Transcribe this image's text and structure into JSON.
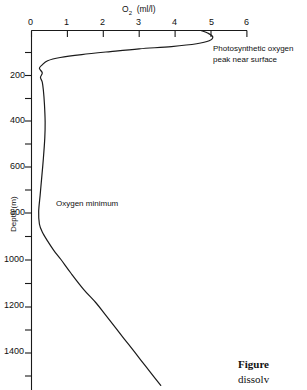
{
  "chart_data": {
    "type": "line",
    "xlabel": "O2  (ml/l)",
    "ylabel": "Depth (m)",
    "xlim": [
      0,
      6
    ],
    "ylim": [
      1550,
      0
    ],
    "x_ticks": [
      0,
      1,
      2,
      3,
      4,
      5,
      6
    ],
    "x_tick_labels": [
      "0",
      "1",
      "2",
      "3",
      "4",
      "5",
      "6"
    ],
    "y_ticks": [
      0,
      100,
      200,
      300,
      400,
      500,
      600,
      700,
      800,
      900,
      1000,
      1100,
      1200,
      1300,
      1400,
      1500
    ],
    "y_tick_labels": [
      "",
      "",
      "200",
      "",
      "400",
      "",
      "600",
      "",
      "800",
      "",
      "1000",
      "",
      "1200",
      "",
      "1400",
      ""
    ],
    "y_major_labeled": [
      200,
      400,
      600,
      800,
      1000,
      1200,
      1400
    ],
    "grid": false,
    "legend": "none",
    "series": [
      {
        "name": "Dissolved oxygen profile",
        "points": [
          [
            4.72,
            0
          ],
          [
            4.92,
            12
          ],
          [
            5.05,
            28
          ],
          [
            4.95,
            45
          ],
          [
            4.6,
            58
          ],
          [
            3.9,
            70
          ],
          [
            3.0,
            80
          ],
          [
            2.2,
            92
          ],
          [
            1.4,
            105
          ],
          [
            0.8,
            118
          ],
          [
            0.45,
            132
          ],
          [
            0.3,
            150
          ],
          [
            0.22,
            165
          ],
          [
            0.3,
            185
          ],
          [
            0.25,
            205
          ],
          [
            0.3,
            225
          ],
          [
            0.33,
            260
          ],
          [
            0.36,
            320
          ],
          [
            0.38,
            400
          ],
          [
            0.37,
            470
          ],
          [
            0.33,
            560
          ],
          [
            0.28,
            650
          ],
          [
            0.24,
            720
          ],
          [
            0.2,
            790
          ],
          [
            0.22,
            845
          ],
          [
            0.3,
            880
          ],
          [
            0.45,
            920
          ],
          [
            0.62,
            960
          ],
          [
            0.82,
            1000
          ],
          [
            1.1,
            1060
          ],
          [
            1.45,
            1130
          ],
          [
            1.8,
            1190
          ],
          [
            2.05,
            1240
          ],
          [
            2.35,
            1300
          ],
          [
            2.7,
            1370
          ],
          [
            3.05,
            1440
          ],
          [
            3.4,
            1510
          ],
          [
            3.6,
            1550
          ]
        ]
      }
    ],
    "annotations": [
      {
        "text_line1": "Photosynthetic oxygen",
        "text_line2": "peak near surface"
      },
      {
        "text": "Oxygen minimum"
      }
    ]
  },
  "axis": {
    "x_title_main": "O",
    "x_title_sub": "2",
    "x_title_unit": "(ml/l)",
    "y_title": "Depth (m)"
  },
  "caption": {
    "figure_word": "Figure",
    "second_line": "dissolv"
  }
}
